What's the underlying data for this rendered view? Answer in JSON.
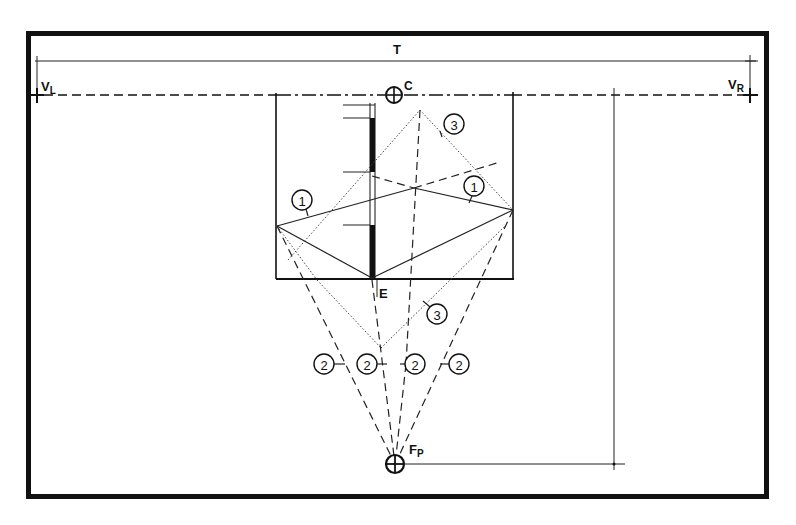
{
  "diagram": {
    "labels": {
      "total_width": "T",
      "vertical_left": "V",
      "vertical_left_sub": "L",
      "vertical_right": "V",
      "vertical_right_sub": "R",
      "center": "C",
      "eye_point": "E",
      "focal_point": "F",
      "focal_point_sub": "P"
    },
    "callouts": [
      {
        "id": "callout-1-left",
        "text": "1"
      },
      {
        "id": "callout-1-right",
        "text": "1"
      },
      {
        "id": "callout-3-top",
        "text": "3"
      },
      {
        "id": "callout-3-bottom",
        "text": "3"
      },
      {
        "id": "callout-2-a",
        "text": "2"
      },
      {
        "id": "callout-2-b",
        "text": "2"
      },
      {
        "id": "callout-2-c",
        "text": "2"
      },
      {
        "id": "callout-2-d",
        "text": "2"
      }
    ],
    "legend": {
      "1": "solid reflection lines",
      "2": "dashed sight lines to focal point",
      "3": "dotted construction lines"
    },
    "colors": {
      "ink": "#111111",
      "paper": "#ffffff"
    }
  }
}
